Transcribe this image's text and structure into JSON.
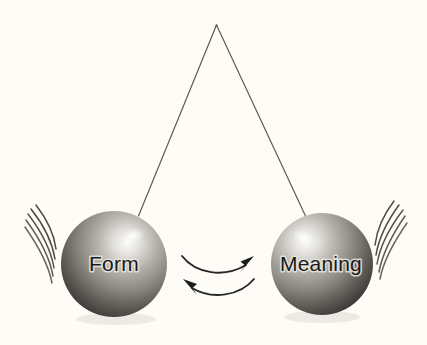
{
  "diagram": {
    "background_color": "#fdfcf6",
    "pendulum": {
      "pivot_label": "pivot-point",
      "pivot_x": 216,
      "pivot_y": 25,
      "string_color": "#5a564f"
    },
    "balls": [
      {
        "id": "left",
        "label": "Form",
        "cx": 114,
        "cy": 264,
        "r": 53,
        "label_color": "#1a1a1a",
        "sphere_light": "#f2f1ee",
        "sphere_mid": "#8b8782",
        "sphere_dark": "#3a3733",
        "motion_side": "left",
        "motion_line_count": 5
      },
      {
        "id": "right",
        "label": "Meaning",
        "cx": 322,
        "cy": 264,
        "r": 51,
        "label_color": "#1a1a1a",
        "sphere_light": "#f2f1ee",
        "sphere_mid": "#8b8782",
        "sphere_dark": "#3a3733",
        "motion_side": "right",
        "motion_line_count": 5
      }
    ],
    "arrows": [
      {
        "id": "form-to-meaning",
        "direction": "right",
        "description": "curved arrow from Form toward Meaning",
        "color": "#282624"
      },
      {
        "id": "meaning-to-form",
        "direction": "left",
        "description": "curved arrow from Meaning back toward Form",
        "color": "#282624"
      }
    ]
  }
}
